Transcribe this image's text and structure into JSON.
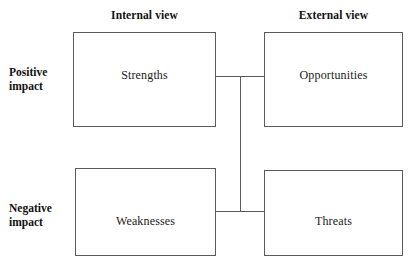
{
  "diagram": {
    "type": "swot-matrix",
    "background_color": "#ffffff",
    "line_color": "#5b5b5b",
    "text_color": "#1a1a1a"
  },
  "column_headers": [
    {
      "id": "internal",
      "label": "Internal view"
    },
    {
      "id": "external",
      "label": "External view"
    }
  ],
  "row_labels": [
    {
      "id": "positive",
      "line1": "Positive",
      "line2": "impact"
    },
    {
      "id": "negative",
      "line1": "Negative",
      "line2": "impact"
    }
  ],
  "quadrants": [
    {
      "id": "strengths",
      "label": "Strengths",
      "row": "positive",
      "column": "internal"
    },
    {
      "id": "opportunities",
      "label": "Opportunities",
      "row": "positive",
      "column": "external"
    },
    {
      "id": "weaknesses",
      "label": "Weaknesses",
      "row": "negative",
      "column": "internal"
    },
    {
      "id": "threats",
      "label": "Threats",
      "row": "negative",
      "column": "external"
    }
  ],
  "connectors": [
    {
      "id": "top",
      "orientation": "horizontal",
      "from": "strengths",
      "to": "opportunities"
    },
    {
      "id": "bottom",
      "orientation": "horizontal",
      "from": "weaknesses",
      "to": "threats"
    },
    {
      "id": "spine",
      "orientation": "vertical",
      "from": "top",
      "to": "bottom"
    }
  ]
}
